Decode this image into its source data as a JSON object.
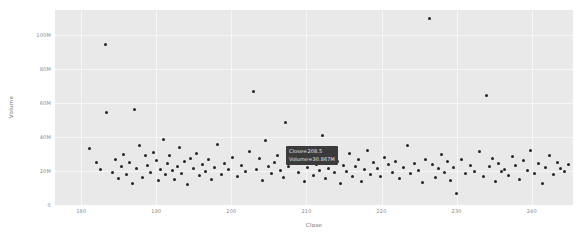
{
  "chart_data": {
    "type": "scatter",
    "title": "",
    "xlabel": "Close",
    "ylabel": "Volume",
    "xlim": [
      176.5,
      245.5
    ],
    "ylim": [
      0,
      115000000
    ],
    "grid": true,
    "legend": null,
    "xticks": [
      180,
      190,
      200,
      210,
      220,
      230,
      240
    ],
    "xtick_labels": [
      "180",
      "190",
      "200",
      "210",
      "220",
      "230",
      "240"
    ],
    "yticks": [
      0,
      20000000,
      40000000,
      60000000,
      80000000,
      100000000
    ],
    "ytick_labels": [
      "0",
      "20M",
      "40M",
      "60M",
      "80M",
      "100M"
    ],
    "marker_color": "#262626",
    "plot_bg": "#e9e9e9",
    "grid_color": "#f7f7f7",
    "points": [
      [
        181.1,
        33200000
      ],
      [
        182.0,
        24800000
      ],
      [
        182.6,
        20900000
      ],
      [
        183.2,
        94800000
      ],
      [
        183.3,
        54500000
      ],
      [
        184.1,
        19300000
      ],
      [
        184.5,
        27100000
      ],
      [
        184.9,
        15800000
      ],
      [
        185.3,
        22600000
      ],
      [
        185.6,
        29800000
      ],
      [
        186.0,
        18200000
      ],
      [
        186.4,
        25300000
      ],
      [
        186.8,
        12900000
      ],
      [
        187.1,
        56600000
      ],
      [
        187.4,
        21700000
      ],
      [
        187.8,
        34800000
      ],
      [
        188.2,
        16400000
      ],
      [
        188.5,
        28900000
      ],
      [
        188.8,
        23100000
      ],
      [
        189.2,
        19000000
      ],
      [
        189.6,
        31200000
      ],
      [
        190.0,
        26400000
      ],
      [
        190.3,
        14200000
      ],
      [
        190.6,
        21000000
      ],
      [
        190.9,
        38600000
      ],
      [
        191.2,
        17800000
      ],
      [
        191.5,
        24300000
      ],
      [
        191.8,
        29100000
      ],
      [
        192.1,
        20200000
      ],
      [
        192.4,
        15100000
      ],
      [
        192.8,
        22800000
      ],
      [
        193.1,
        33900000
      ],
      [
        193.4,
        18700000
      ],
      [
        193.8,
        25800000
      ],
      [
        194.1,
        12100000
      ],
      [
        194.5,
        27600000
      ],
      [
        194.9,
        21400000
      ],
      [
        195.3,
        30500000
      ],
      [
        195.7,
        17200000
      ],
      [
        196.1,
        23700000
      ],
      [
        196.5,
        19600000
      ],
      [
        196.9,
        26900000
      ],
      [
        197.3,
        14800000
      ],
      [
        197.8,
        22200000
      ],
      [
        198.2,
        35400000
      ],
      [
        198.7,
        18000000
      ],
      [
        199.1,
        24600000
      ],
      [
        199.6,
        20700000
      ],
      [
        200.2,
        28300000
      ],
      [
        200.8,
        16700000
      ],
      [
        201.3,
        23400000
      ],
      [
        201.9,
        19900000
      ],
      [
        202.4,
        31800000
      ],
      [
        202.9,
        66800000
      ],
      [
        203.3,
        21100000
      ],
      [
        203.7,
        27300000
      ],
      [
        204.1,
        14500000
      ],
      [
        204.5,
        38100000
      ],
      [
        204.9,
        22500000
      ],
      [
        205.3,
        18400000
      ],
      [
        205.7,
        25100000
      ],
      [
        206.1,
        29400000
      ],
      [
        206.5,
        20400000
      ],
      [
        206.9,
        16100000
      ],
      [
        207.2,
        48800000
      ],
      [
        207.6,
        23000000
      ],
      [
        208.0,
        33500000
      ],
      [
        208.5,
        30867000
      ],
      [
        208.9,
        19400000
      ],
      [
        209.3,
        26200000
      ],
      [
        209.7,
        13600000
      ],
      [
        210.1,
        22000000
      ],
      [
        210.5,
        28600000
      ],
      [
        210.9,
        17500000
      ],
      [
        211.3,
        24000000
      ],
      [
        211.7,
        20100000
      ],
      [
        212.1,
        41200000
      ],
      [
        212.5,
        15400000
      ],
      [
        212.9,
        21800000
      ],
      [
        213.3,
        27800000
      ],
      [
        213.7,
        18900000
      ],
      [
        214.1,
        25500000
      ],
      [
        214.5,
        12400000
      ],
      [
        214.9,
        23300000
      ],
      [
        215.3,
        19700000
      ],
      [
        215.7,
        30100000
      ],
      [
        216.1,
        16900000
      ],
      [
        216.5,
        22700000
      ],
      [
        216.9,
        26600000
      ],
      [
        217.3,
        14000000
      ],
      [
        217.7,
        20800000
      ],
      [
        218.1,
        32400000
      ],
      [
        218.5,
        18100000
      ],
      [
        218.9,
        24900000
      ],
      [
        219.4,
        21300000
      ],
      [
        219.9,
        17000000
      ],
      [
        220.4,
        28000000
      ],
      [
        220.9,
        23600000
      ],
      [
        221.4,
        19100000
      ],
      [
        221.9,
        25700000
      ],
      [
        222.4,
        15700000
      ],
      [
        222.9,
        22100000
      ],
      [
        223.4,
        35000000
      ],
      [
        223.9,
        18600000
      ],
      [
        224.4,
        24200000
      ],
      [
        224.9,
        20500000
      ],
      [
        225.4,
        13100000
      ],
      [
        225.9,
        27000000
      ],
      [
        226.4,
        110200000
      ],
      [
        226.8,
        23900000
      ],
      [
        227.2,
        16300000
      ],
      [
        227.6,
        21600000
      ],
      [
        228.0,
        29700000
      ],
      [
        228.4,
        19200000
      ],
      [
        228.8,
        25900000
      ],
      [
        229.2,
        14700000
      ],
      [
        229.6,
        22400000
      ],
      [
        230.0,
        6900000
      ],
      [
        230.6,
        26800000
      ],
      [
        231.2,
        18300000
      ],
      [
        231.8,
        23200000
      ],
      [
        232.4,
        20000000
      ],
      [
        233.0,
        31500000
      ],
      [
        233.6,
        16600000
      ],
      [
        234.0,
        64800000
      ],
      [
        234.4,
        22900000
      ],
      [
        234.8,
        27500000
      ],
      [
        235.2,
        13800000
      ],
      [
        235.6,
        24400000
      ],
      [
        236.0,
        19800000
      ],
      [
        236.4,
        21200000
      ],
      [
        236.9,
        17300000
      ],
      [
        237.4,
        28800000
      ],
      [
        237.9,
        23500000
      ],
      [
        238.4,
        15000000
      ],
      [
        238.9,
        26100000
      ],
      [
        239.4,
        20600000
      ],
      [
        239.9,
        32000000
      ],
      [
        240.4,
        18800000
      ],
      [
        240.9,
        24700000
      ],
      [
        241.4,
        12700000
      ],
      [
        241.9,
        22300000
      ],
      [
        242.4,
        29000000
      ],
      [
        242.9,
        17700000
      ],
      [
        243.4,
        25200000
      ],
      [
        243.9,
        21500000
      ],
      [
        244.4,
        19500000
      ],
      [
        244.9,
        23800000
      ]
    ]
  },
  "tooltip": {
    "visible": true,
    "line1": "Close=208.5",
    "line2": "Volume=30.867M",
    "bg_color": "#3b3b3b",
    "text_color": "#e8e8e8"
  }
}
